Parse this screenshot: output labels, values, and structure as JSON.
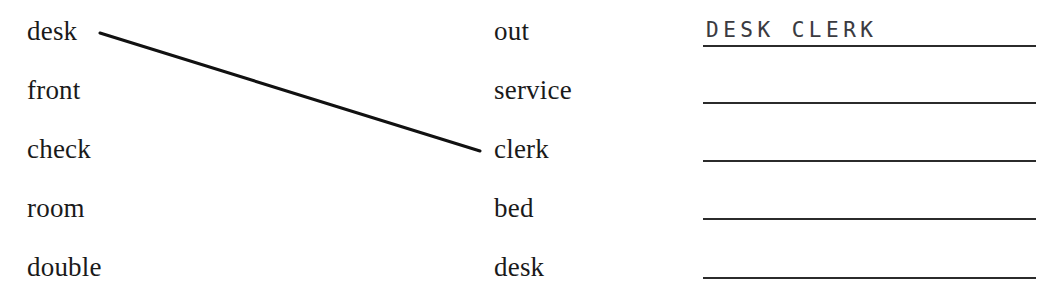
{
  "worksheet": {
    "type": "matching-exercise",
    "background_color": "#ffffff",
    "ink_color": "#1a1a1a",
    "handwriting_color": "#3a3a3f"
  },
  "left_column": {
    "name": "first-word-column",
    "words": [
      "desk",
      "front",
      "check",
      "room",
      "double"
    ]
  },
  "right_column": {
    "name": "second-word-column",
    "words": [
      "out",
      "service",
      "clerk",
      "bed",
      "desk"
    ]
  },
  "match_lines": [
    {
      "from_word": "desk",
      "to_word": "clerk",
      "x1": 100,
      "y1": 33,
      "x2": 480,
      "y2": 151,
      "stroke_width": 3,
      "color": "#111111"
    }
  ],
  "answer_lines": [
    {
      "value": "DESK CLERK",
      "filled": true
    },
    {
      "value": "",
      "filled": false
    },
    {
      "value": "",
      "filled": false
    },
    {
      "value": "",
      "filled": false
    },
    {
      "value": "",
      "filled": false
    }
  ]
}
